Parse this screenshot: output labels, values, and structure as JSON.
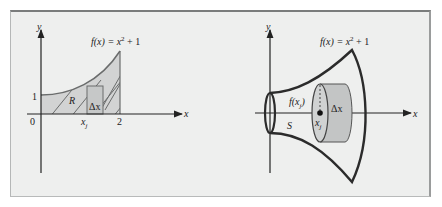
{
  "figure": {
    "left_panel": {
      "function_label": "f(x) = x² + 1",
      "function_label_parts": {
        "lhs": "f(x) = x",
        "exp": "2",
        "rhs": " + 1"
      },
      "y_axis_label": "y",
      "x_axis_label": "x",
      "origin_label": "0",
      "y_tick_label": "1",
      "x_tick_label": "2",
      "region_label": "R",
      "rect_width_label": "Δx",
      "sample_point_label": "x",
      "sample_point_sub": "j"
    },
    "right_panel": {
      "function_label_parts": {
        "lhs": "f(x) = x",
        "exp": "2",
        "rhs": " + 1"
      },
      "y_axis_label": "y",
      "x_axis_label": "x",
      "solid_label": "S",
      "radius_label": "f(x",
      "radius_label_sub": "j",
      "radius_label_close": ")",
      "disk_width_label": "Δx",
      "sample_point_label": "x",
      "sample_point_sub": "j"
    },
    "colors": {
      "background": "#eeefee",
      "region_fill": "#d2d3d3",
      "disk_fill": "#c3c5c5",
      "stroke": "#2b2b2b",
      "curve_stroke": "#6a6c6c"
    }
  }
}
